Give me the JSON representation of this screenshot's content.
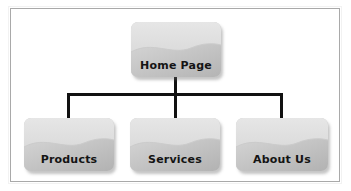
{
  "diagram": {
    "title_text": "",
    "frame": {
      "border_color": "#a9a9a9",
      "background": "#ffffff"
    },
    "connector_color": "#111111",
    "node_fill_light": "#e3e3e3",
    "node_fill_dark": "#b9b9b9",
    "label_color": "#141414",
    "nodes": [
      {
        "id": "home",
        "label": "Home Page",
        "level": 0
      },
      {
        "id": "products",
        "label": "Products",
        "level": 1
      },
      {
        "id": "services",
        "label": "Services",
        "level": 1
      },
      {
        "id": "about",
        "label": "About Us",
        "level": 1
      }
    ],
    "edges": [
      {
        "from": "Home Page",
        "to": "Products"
      },
      {
        "from": "Home Page",
        "to": "Services"
      },
      {
        "from": "Home Page",
        "to": "About Us"
      }
    ]
  }
}
